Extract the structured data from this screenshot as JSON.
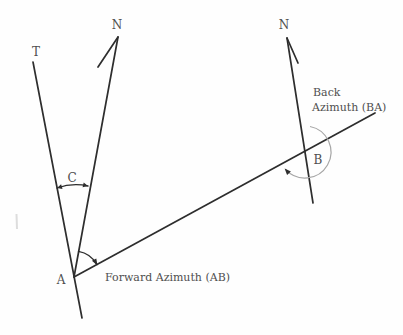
{
  "diagram": {
    "labels": {
      "t": "T",
      "n_left": "N",
      "n_right": "N",
      "c": "C",
      "a": "A",
      "b": "B",
      "forward_azimuth": "Forward Azimuth (AB)",
      "back_azimuth_line1": "Back",
      "back_azimuth_line2": "Azimuth (BA)"
    },
    "colors": {
      "background": "#fefefe",
      "line": "#2d2d2d",
      "arc": "#a6a6a6",
      "text": "#4f4f4f",
      "artifact": "#dddddd"
    }
  }
}
